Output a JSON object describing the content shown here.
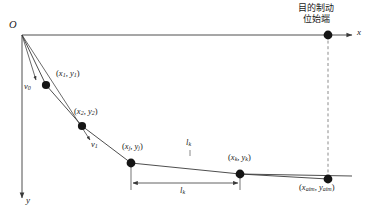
{
  "figure": {
    "kind": "coordinate-trajectory-diagram",
    "background_color": "#ffffff",
    "stroke_color": "#3a3a3a",
    "node_color": "#151515",
    "origin_label": "O",
    "x_axis_label": "x",
    "y_axis_label": "y",
    "annotation_cjk": {
      "line1": "目的制动",
      "line2": "位始端"
    },
    "points": [
      {
        "id": "p1",
        "label_x": "x",
        "label_x_sub": "1",
        "label_y": "y",
        "label_y_sub": "1",
        "text": "(x₁, y₁)"
      },
      {
        "id": "p2",
        "label_x": "x",
        "label_x_sub": "2",
        "label_y": "y",
        "label_y_sub": "2",
        "text": "(x₂, y₂)"
      },
      {
        "id": "pj",
        "label_x": "x",
        "label_x_sub": "j",
        "label_y": "y",
        "label_y_sub": "j",
        "text": "(xⱼ, yⱼ)"
      },
      {
        "id": "pk",
        "label_x": "x",
        "label_x_sub": "k",
        "label_y": "y",
        "label_y_sub": "k",
        "text": "(xₖ, yₖ)"
      },
      {
        "id": "paim",
        "label_x": "x",
        "label_x_sub": "aim",
        "label_y": "y",
        "label_y_sub": "aim",
        "text": "(x_aim, y_aim)"
      }
    ],
    "velocities": [
      {
        "id": "v0",
        "base": "v",
        "sub": "0"
      },
      {
        "id": "v1",
        "base": "v",
        "sub": "1"
      }
    ],
    "segments": [
      {
        "id": "lk-upper",
        "base": "l",
        "sub": "k"
      },
      {
        "id": "lk-lower",
        "base": "l",
        "sub": "k"
      }
    ]
  }
}
